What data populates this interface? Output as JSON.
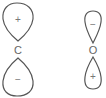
{
  "diagram": {
    "type": "p-orbital phases",
    "atoms": [
      {
        "label": "C",
        "top_lobe": {
          "sign": "+"
        },
        "bottom_lobe": {
          "sign": "−"
        }
      },
      {
        "label": "O",
        "top_lobe": {
          "sign": "−"
        },
        "bottom_lobe": {
          "sign": "+"
        }
      }
    ],
    "colors": {
      "stroke": "#555555",
      "text": "#666666",
      "background": "#ffffff"
    }
  }
}
